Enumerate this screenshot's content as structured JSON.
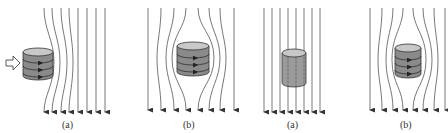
{
  "diagram": {
    "panels": [
      {
        "label": "(a)",
        "field": "deflected",
        "has_push_arrow": true,
        "current_loops": 3
      },
      {
        "label": "(b)",
        "field": "expelled",
        "has_push_arrow": false,
        "current_loops": 3
      },
      {
        "label": "(a)",
        "field": "penetrating",
        "has_push_arrow": false,
        "current_loops": 0
      },
      {
        "label": "(b)",
        "field": "expelled",
        "has_push_arrow": false,
        "current_loops": 3
      }
    ],
    "colors": {
      "line": "#555555",
      "cylinder_side": "#8a8a8a",
      "cylinder_top": "#c8c8c8",
      "outline": "#333333"
    }
  }
}
